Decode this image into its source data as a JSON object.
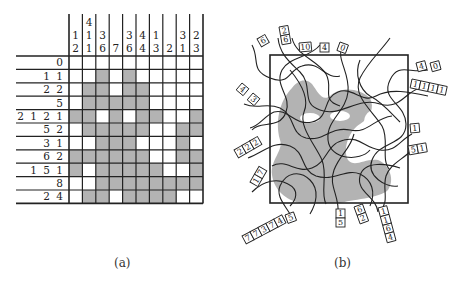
{
  "panel_a": {
    "caption": "(a)",
    "column_clues": [
      [
        "1",
        "2"
      ],
      [
        "4",
        "1",
        "1"
      ],
      [
        "3",
        "6"
      ],
      [
        "7"
      ],
      [
        "3",
        "6"
      ],
      [
        "4",
        "4"
      ],
      [
        "1",
        "3"
      ],
      [
        "2"
      ],
      [
        "3",
        "1"
      ],
      [
        "2",
        "3"
      ]
    ],
    "row_clues": [
      [
        "0"
      ],
      [
        "1",
        "1"
      ],
      [
        "2",
        "2"
      ],
      [
        "5"
      ],
      [
        "2",
        "1",
        "2",
        "1"
      ],
      [
        "5",
        "2"
      ],
      [
        "3",
        "1"
      ],
      [
        "6",
        "2"
      ],
      [
        "1",
        "5",
        "1"
      ],
      [
        "8"
      ],
      [
        "2",
        "4"
      ]
    ],
    "grid": [
      [
        0,
        0,
        0,
        0,
        0,
        0,
        0,
        0,
        0,
        0
      ],
      [
        0,
        0,
        1,
        0,
        1,
        0,
        0,
        0,
        0,
        0
      ],
      [
        0,
        1,
        1,
        0,
        1,
        1,
        0,
        0,
        0,
        0
      ],
      [
        0,
        1,
        1,
        1,
        1,
        1,
        0,
        0,
        0,
        0
      ],
      [
        1,
        1,
        0,
        1,
        0,
        1,
        1,
        0,
        0,
        1
      ],
      [
        0,
        1,
        1,
        1,
        1,
        1,
        0,
        0,
        1,
        1
      ],
      [
        0,
        0,
        1,
        1,
        1,
        0,
        0,
        0,
        1,
        0
      ],
      [
        1,
        1,
        1,
        1,
        1,
        1,
        0,
        0,
        1,
        1
      ],
      [
        1,
        0,
        1,
        1,
        1,
        1,
        1,
        0,
        0,
        1
      ],
      [
        0,
        0,
        1,
        1,
        1,
        1,
        1,
        1,
        1,
        1
      ],
      [
        0,
        1,
        1,
        0,
        1,
        1,
        1,
        1,
        0,
        0
      ]
    ],
    "fill_color": "#b3b3b3",
    "line_color": "#222222"
  },
  "panel_b": {
    "caption": "(b)",
    "fill_color": "#b3b3b3",
    "labels": [
      {
        "id": "top-6",
        "cells": [
          "6"
        ]
      },
      {
        "id": "top-2-6",
        "cells": [
          "2",
          "6"
        ]
      },
      {
        "id": "top-10",
        "cells": [
          "10"
        ]
      },
      {
        "id": "top-4",
        "cells": [
          "4"
        ]
      },
      {
        "id": "top-0",
        "cells": [
          "0"
        ]
      },
      {
        "id": "right-4",
        "cells": [
          "4"
        ]
      },
      {
        "id": "right-0",
        "cells": [
          "0"
        ]
      },
      {
        "id": "right-1111",
        "cells": [
          "1",
          "1",
          "1",
          "1"
        ]
      },
      {
        "id": "right-1",
        "cells": [
          "1"
        ]
      },
      {
        "id": "right-5-1",
        "cells": [
          "5",
          "1"
        ]
      },
      {
        "id": "left-4",
        "cells": [
          "4"
        ]
      },
      {
        "id": "left-3",
        "cells": [
          "3"
        ]
      },
      {
        "id": "left-2-2-2",
        "cells": [
          "2",
          "2",
          "2"
        ]
      },
      {
        "id": "left-1-7",
        "cells": [
          "1",
          "7"
        ]
      },
      {
        "id": "bottom-5",
        "cells": [
          "5"
        ]
      },
      {
        "id": "bottom-77374",
        "cells": [
          "7",
          "7",
          "3",
          "7",
          "4"
        ]
      },
      {
        "id": "bottom-1-5",
        "cells": [
          "1",
          "5"
        ]
      },
      {
        "id": "bottom-6-2",
        "cells": [
          "6",
          "2"
        ]
      },
      {
        "id": "bottom-1-1-6-4",
        "cells": [
          "1",
          "1",
          "6",
          "4"
        ]
      }
    ]
  }
}
